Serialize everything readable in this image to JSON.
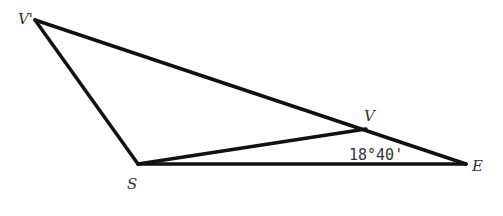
{
  "diagram": {
    "points": {
      "V_prime": {
        "label": "V'",
        "x": 35,
        "y": 20
      },
      "S": {
        "label": "S",
        "x": 138,
        "y": 164
      },
      "E": {
        "label": "E",
        "x": 466,
        "y": 164
      },
      "V": {
        "label": "V",
        "x": 366,
        "y": 129
      }
    },
    "angle_label": "18°40'",
    "colors": {
      "line": "#111111",
      "text": "#333333"
    }
  }
}
